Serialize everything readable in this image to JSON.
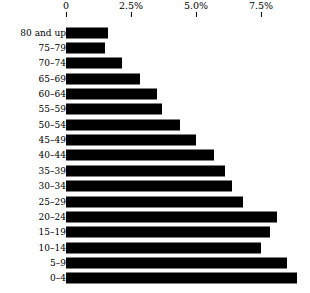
{
  "chart_data": {
    "type": "bar",
    "orientation": "horizontal",
    "title": "",
    "subtitle": "",
    "xlabel": "",
    "ylabel": "",
    "xlim": [
      0,
      9.3
    ],
    "ylim": null,
    "grid": false,
    "legend": null,
    "legend_position": "none",
    "axis_position": "top",
    "bar_color": "#000000",
    "background_color": "#ffffff",
    "x_ticks": [
      {
        "value": 0,
        "label": "0"
      },
      {
        "value": 2.5,
        "label": "2.5%"
      },
      {
        "value": 5.0,
        "label": "5.0%"
      },
      {
        "value": 7.5,
        "label": "7.5%"
      }
    ],
    "categories": [
      "80 and up",
      "75–79",
      "70–74",
      "65–69",
      "60–64",
      "55–59",
      "50–54",
      "45–49",
      "40–44",
      "35–39",
      "30–34",
      "25–29",
      "20–24",
      "15–19",
      "10–14",
      "5–9",
      "0–4"
    ],
    "values": [
      1.6,
      1.5,
      2.15,
      2.85,
      3.5,
      3.7,
      4.4,
      5.0,
      5.7,
      6.1,
      6.4,
      6.8,
      8.1,
      7.85,
      7.5,
      8.5,
      8.9
    ]
  }
}
